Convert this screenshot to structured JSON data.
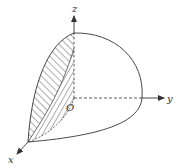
{
  "figure": {
    "axes": {
      "x_label": "x",
      "y_label": "y",
      "z_label": "z",
      "origin_label": "O"
    },
    "colors": {
      "stroke": "#333333",
      "background": "#ffffff"
    }
  }
}
